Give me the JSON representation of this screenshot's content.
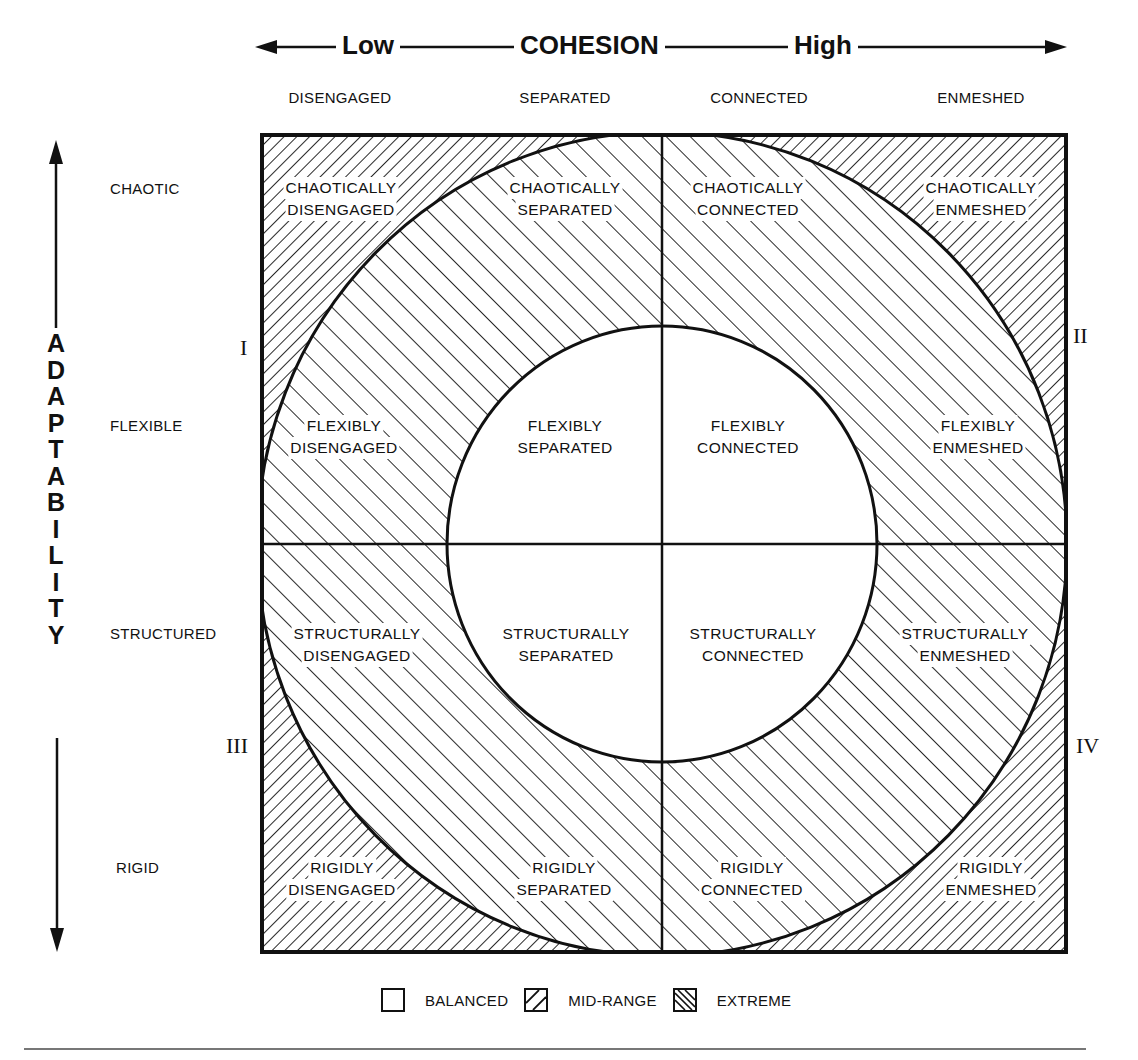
{
  "title": {
    "axis_name": "COHESION",
    "low_label": "Low",
    "high_label": "High"
  },
  "cohesion_levels": [
    {
      "label": "DISENGAGED"
    },
    {
      "label": "SEPARATED"
    },
    {
      "label": "CONNECTED"
    },
    {
      "label": "ENMESHED"
    }
  ],
  "adaptability": {
    "axis_name": "ADAPTABILITY",
    "letters": [
      "A",
      "D",
      "A",
      "P",
      "T",
      "A",
      "B",
      "I",
      "L",
      "I",
      "T",
      "Y"
    ],
    "levels": [
      {
        "label": "CHAOTIC"
      },
      {
        "label": "FLEXIBLE"
      },
      {
        "label": "STRUCTURED"
      },
      {
        "label": "RIGID"
      }
    ]
  },
  "quadrant_numerals": {
    "q1": "I",
    "q2": "II",
    "q3": "III",
    "q4": "IV"
  },
  "cells": {
    "chaotic": [
      {
        "line1": "CHAOTICALLY",
        "line2": "DISENGAGED",
        "type": "extreme"
      },
      {
        "line1": "CHAOTICALLY",
        "line2": "SEPARATED",
        "type": "mid-range"
      },
      {
        "line1": "CHAOTICALLY",
        "line2": "CONNECTED",
        "type": "mid-range"
      },
      {
        "line1": "CHAOTICALLY",
        "line2": "ENMESHED",
        "type": "extreme"
      }
    ],
    "flexible": [
      {
        "line1": "FLEXIBLY",
        "line2": "DISENGAGED",
        "type": "mid-range"
      },
      {
        "line1": "FLEXIBLY",
        "line2": "SEPARATED",
        "type": "balanced"
      },
      {
        "line1": "FLEXIBLY",
        "line2": "CONNECTED",
        "type": "balanced"
      },
      {
        "line1": "FLEXIBLY",
        "line2": "ENMESHED",
        "type": "mid-range"
      }
    ],
    "structured": [
      {
        "line1": "STRUCTURALLY",
        "line2": "DISENGAGED",
        "type": "mid-range"
      },
      {
        "line1": "STRUCTURALLY",
        "line2": "SEPARATED",
        "type": "balanced"
      },
      {
        "line1": "STRUCTURALLY",
        "line2": "CONNECTED",
        "type": "balanced"
      },
      {
        "line1": "STRUCTURALLY",
        "line2": "ENMESHED",
        "type": "mid-range"
      }
    ],
    "rigid": [
      {
        "line1": "RIGIDLY",
        "line2": "DISENGAGED",
        "type": "extreme"
      },
      {
        "line1": "RIGIDLY",
        "line2": "SEPARATED",
        "type": "mid-range"
      },
      {
        "line1": "RIGIDLY",
        "line2": "CONNECTED",
        "type": "mid-range"
      },
      {
        "line1": "RIGIDLY",
        "line2": "ENMESHED",
        "type": "extreme"
      }
    ]
  },
  "legend": [
    {
      "label": "BALANCED",
      "pattern": "blank"
    },
    {
      "label": "MID-RANGE",
      "pattern": "forward-hatch"
    },
    {
      "label": "EXTREME",
      "pattern": "back-hatch-dense"
    }
  ],
  "colors": {
    "ink": "#111111",
    "paper": "#ffffff",
    "rule": "#777777"
  }
}
